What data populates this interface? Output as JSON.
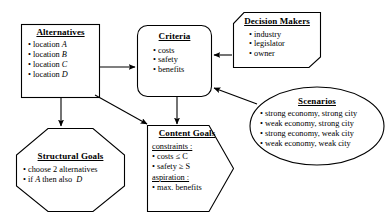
{
  "diagram": {
    "type": "flow-diagram",
    "nodes": [
      {
        "id": "alternatives",
        "title": "Alternatives",
        "shape": "rectangle",
        "items": [
          "location A",
          "location B",
          "location C",
          "location D"
        ]
      },
      {
        "id": "criteria",
        "title": "Criteria",
        "shape": "rounded-rectangle",
        "items": [
          "costs",
          "safety",
          "benefits"
        ]
      },
      {
        "id": "decision_makers",
        "title": "Decision Makers",
        "shape": "chamfered-rectangle",
        "items": [
          "industry",
          "legislator",
          "owner"
        ]
      },
      {
        "id": "scenarios",
        "title": "Scenarios",
        "shape": "ellipse",
        "items": [
          "strong economy, strong city",
          "weak economy, strong city",
          "strong economy, weak city",
          "weak economy, weak city"
        ]
      },
      {
        "id": "structural_goals",
        "title": "Structural Goals",
        "shape": "octagon",
        "items": [
          "choose 2 alternatives",
          "if A then also  D"
        ]
      },
      {
        "id": "content_goals",
        "title": "Content Goals",
        "shape": "pentagon-arrow",
        "constraints_label": "constraints :",
        "constraints": [
          "costs ≤ C",
          "safety ≥ S"
        ],
        "aspiration_label": "aspiration :",
        "aspiration": [
          "max. benefits"
        ]
      }
    ],
    "edges": [
      {
        "from": "alternatives",
        "to": "criteria",
        "style": "straight-arrow"
      },
      {
        "from": "alternatives",
        "to": "structural_goals",
        "style": "straight-arrow"
      },
      {
        "from": "alternatives",
        "to": "content_goals",
        "style": "straight-arrow"
      },
      {
        "from": "criteria",
        "to": "content_goals",
        "style": "straight-arrow"
      },
      {
        "from": "decision_makers",
        "to": "criteria",
        "style": "straight-arrow"
      },
      {
        "from": "scenarios",
        "to": "criteria",
        "style": "straight-arrow"
      }
    ],
    "colors": {
      "stroke": "#000000",
      "background": "#ffffff",
      "text": "#000000"
    }
  }
}
